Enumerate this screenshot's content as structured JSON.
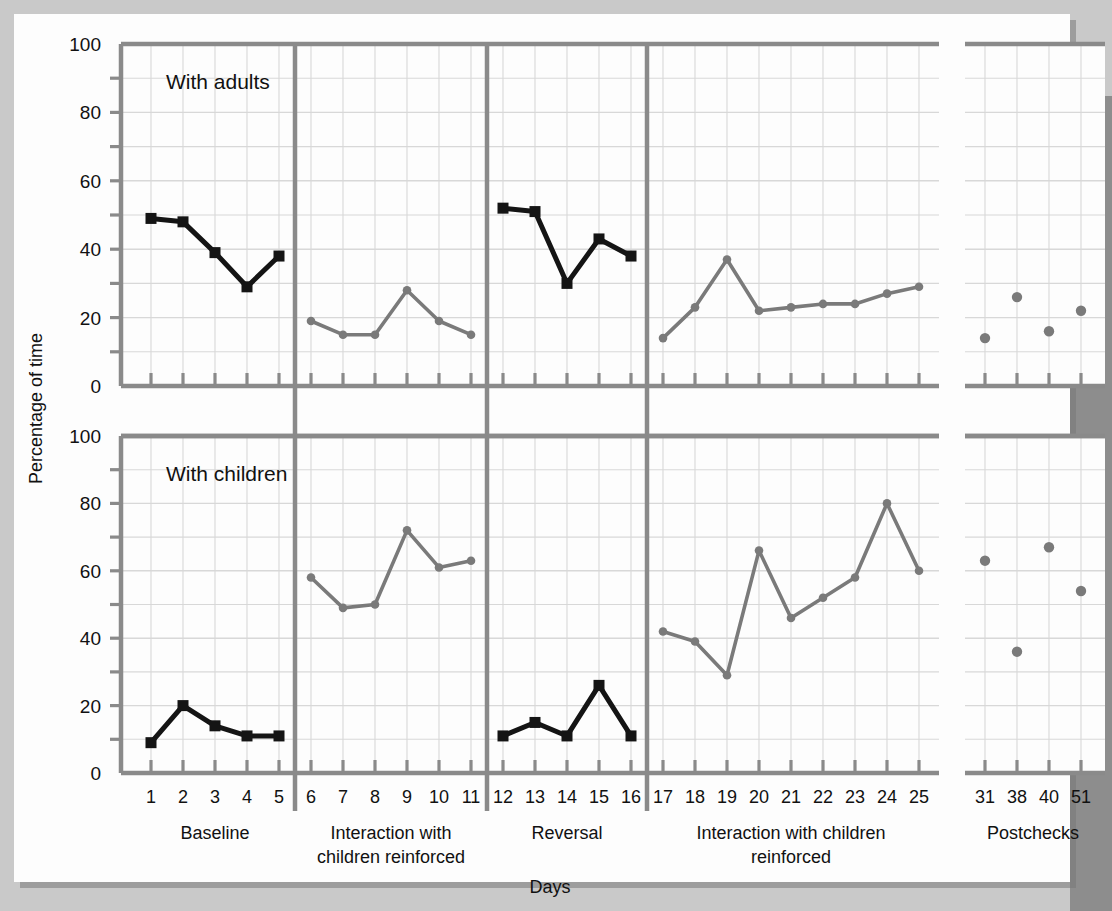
{
  "chart_data": {
    "type": "line",
    "title": "",
    "xlabel": "Days",
    "ylabel": "Percentage of time",
    "ylim": [
      0,
      100
    ],
    "ytick_labels": [
      "0",
      "20",
      "40",
      "60",
      "80",
      "100"
    ],
    "ytick_values": [
      0,
      20,
      40,
      60,
      80,
      100
    ],
    "minor_tick_step": 10,
    "grid": true,
    "legend_position": "none",
    "panels": [
      {
        "name": "with-adults",
        "label": "With adults",
        "series": [
          {
            "name": "Baseline",
            "marker": "square",
            "color": "#141414",
            "x": [
              1,
              2,
              3,
              4,
              5
            ],
            "values": [
              49,
              48,
              39,
              29,
              38
            ]
          },
          {
            "name": "Interaction with children reinforced",
            "marker": "circle",
            "color": "#7a7a7a",
            "x": [
              6,
              7,
              8,
              9,
              10,
              11
            ],
            "values": [
              19,
              15,
              15,
              28,
              19,
              15
            ]
          },
          {
            "name": "Reversal",
            "marker": "square",
            "color": "#141414",
            "x": [
              12,
              13,
              14,
              15,
              16
            ],
            "values": [
              52,
              51,
              30,
              43,
              38
            ]
          },
          {
            "name": "Interaction with children reinforced 2",
            "marker": "circle",
            "color": "#7a7a7a",
            "x": [
              17,
              18,
              19,
              20,
              21,
              22,
              23,
              24,
              25
            ],
            "values": [
              14,
              23,
              37,
              22,
              23,
              24,
              24,
              27,
              29
            ]
          },
          {
            "name": "Postchecks",
            "marker": "circle-only",
            "color": "#7a7a7a",
            "x": [
              31,
              38,
              40,
              51
            ],
            "values": [
              14,
              26,
              16,
              22
            ]
          }
        ]
      },
      {
        "name": "with-children",
        "label": "With children",
        "series": [
          {
            "name": "Baseline",
            "marker": "square",
            "color": "#141414",
            "x": [
              1,
              2,
              3,
              4,
              5
            ],
            "values": [
              9,
              20,
              14,
              11,
              11
            ]
          },
          {
            "name": "Interaction with children reinforced",
            "marker": "circle",
            "color": "#7a7a7a",
            "x": [
              6,
              7,
              8,
              9,
              10,
              11
            ],
            "values": [
              58,
              49,
              50,
              72,
              61,
              63
            ]
          },
          {
            "name": "Reversal",
            "marker": "square",
            "color": "#141414",
            "x": [
              12,
              13,
              14,
              15,
              16
            ],
            "values": [
              11,
              15,
              11,
              26,
              11
            ]
          },
          {
            "name": "Interaction with children reinforced 2",
            "marker": "circle",
            "color": "#7a7a7a",
            "x": [
              17,
              18,
              19,
              20,
              21,
              22,
              23,
              24,
              25
            ],
            "values": [
              42,
              39,
              29,
              66,
              46,
              52,
              58,
              80,
              60
            ]
          },
          {
            "name": "Postchecks",
            "marker": "circle-only",
            "color": "#7a7a7a",
            "x": [
              31,
              38,
              40,
              51
            ],
            "values": [
              63,
              36,
              67,
              54
            ]
          }
        ]
      }
    ],
    "xtick_labels": [
      "1",
      "2",
      "3",
      "4",
      "5",
      "6",
      "7",
      "8",
      "9",
      "10",
      "11",
      "12",
      "13",
      "14",
      "15",
      "16",
      "17",
      "18",
      "19",
      "20",
      "21",
      "22",
      "23",
      "24",
      "25",
      "31",
      "38",
      "40",
      "51"
    ],
    "phases": [
      {
        "label": "Baseline",
        "line2": "",
        "first_day": 1,
        "last_day": 5
      },
      {
        "label": "Interaction with",
        "line2": "children reinforced",
        "first_day": 6,
        "last_day": 11
      },
      {
        "label": "Reversal",
        "line2": "",
        "first_day": 12,
        "last_day": 16
      },
      {
        "label": "Interaction with children",
        "line2": "reinforced",
        "first_day": 17,
        "last_day": 25
      },
      {
        "label": "Postchecks",
        "line2": "",
        "first_day": 31,
        "last_day": 51
      }
    ]
  },
  "colors": {
    "black_series": "#141414",
    "gray_series": "#7a7a7a",
    "axis": "#8a8a8a",
    "grid": "#d8d8d8",
    "page_background": "#c9c9c9",
    "card_background": "#fdfdfd"
  }
}
